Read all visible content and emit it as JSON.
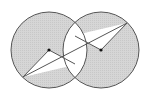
{
  "diagram": {
    "type": "geometry",
    "colors": {
      "shade": "#d4d4d4",
      "stroke": "#555555",
      "background": "#ffffff",
      "point": "#111111"
    },
    "circles": [
      {
        "name": "left-circle",
        "cx": 49,
        "cy": 50,
        "r": 38
      },
      {
        "name": "right-circle",
        "cx": 101,
        "cy": 50,
        "r": 38
      }
    ],
    "points": [
      {
        "name": "left-center",
        "x": 49,
        "y": 50
      },
      {
        "name": "right-center",
        "x": 101,
        "y": 50
      }
    ],
    "segments": [
      {
        "name": "long-diagonal",
        "x1": 23,
        "y1": 77,
        "x2": 127,
        "y2": 23
      },
      {
        "name": "left-radius",
        "x1": 23,
        "y1": 77,
        "x2": 49,
        "y2": 50
      },
      {
        "name": "left-inner",
        "x1": 49,
        "y1": 50,
        "x2": 75,
        "y2": 64
      },
      {
        "name": "right-radius",
        "x1": 127,
        "y1": 23,
        "x2": 101,
        "y2": 50
      },
      {
        "name": "right-inner",
        "x1": 101,
        "y1": 50,
        "x2": 75,
        "y2": 36
      }
    ]
  }
}
